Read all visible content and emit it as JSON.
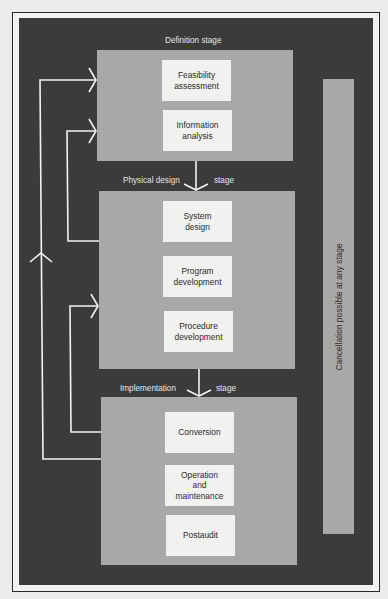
{
  "diagram": {
    "type": "systems development life cycle flow",
    "colors": {
      "page_background": "#ececea",
      "panel_background": "#3b3b3b",
      "stage_box": "#a8a8a6",
      "activity_box": "#f1f1ef",
      "arrows": "#f2f2f2"
    },
    "stages": [
      {
        "label": "Definition stage",
        "activities": [
          {
            "label": "Feasibility\nassessment"
          },
          {
            "label": "Information\nanalysis"
          }
        ]
      },
      {
        "label_left": "Physical design",
        "label_right": "stage",
        "activities": [
          {
            "label": "System\ndesign"
          },
          {
            "label": "Program\ndevelopment"
          },
          {
            "label": "Procedure\ndevelopment"
          }
        ]
      },
      {
        "label_left": "Implementation",
        "label_right": "stage",
        "activities": [
          {
            "label": "Conversion"
          },
          {
            "label": "Operation\nand\nmaintenance"
          },
          {
            "label": "Postaudit"
          }
        ]
      }
    ],
    "cancellation_note": "Cancellation possible at any stage",
    "feedback_loops": [
      {
        "from": "Implementation stage",
        "to": "Feasibility assessment"
      },
      {
        "from": "System design",
        "to": "Information analysis"
      },
      {
        "from": "Implementation stage",
        "to": "Program development"
      }
    ]
  }
}
